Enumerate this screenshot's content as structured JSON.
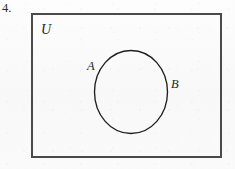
{
  "figure": {
    "problem_number": "4.",
    "universal_set_label": "U",
    "labels": {
      "a": "A",
      "b": "B"
    },
    "colors": {
      "page_background": "#fbfbfb",
      "rect_border": "#4a4a4a",
      "circle_stroke": "#1f1f1f",
      "text": "#232323"
    },
    "geometry": {
      "rect": {
        "x": 31,
        "y": 13,
        "width": 191,
        "height": 145,
        "border_width": 2
      },
      "circle": {
        "cx": 131,
        "cy": 92,
        "rx": 36,
        "ry": 41,
        "stroke_width": 1.35
      },
      "label_a": {
        "x": 87,
        "y": 60
      },
      "label_b": {
        "x": 171,
        "y": 78
      },
      "universal_label": {
        "x": 41,
        "y": 22
      },
      "problem_number": {
        "x": 2,
        "y": 2
      }
    }
  }
}
